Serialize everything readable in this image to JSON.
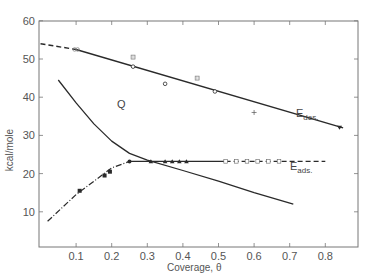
{
  "chart_data": {
    "type": "line",
    "title": "",
    "xlabel": "Coverage, θ",
    "ylabel": "kcal/mole",
    "xlim": [
      0.0,
      0.9
    ],
    "ylim": [
      0,
      60
    ],
    "x_ticks": [
      "0.1",
      "0.2",
      "0.3",
      "0.4",
      "0.5",
      "0.6",
      "0.7",
      "0.8"
    ],
    "y_ticks": [
      "10",
      "20",
      "30",
      "40",
      "50",
      "60"
    ],
    "grid": false,
    "legend": "none (curves labeled inline)",
    "annotations": [
      "Q",
      "E des.",
      "E ads."
    ],
    "series": [
      {
        "name": "E des.",
        "style": "solid line (dashed at low coverage)",
        "line": [
          [
            0.0,
            54.0
          ],
          [
            0.1,
            52.5
          ],
          [
            0.85,
            32.0
          ]
        ],
        "markers": [
          {
            "x": 0.1,
            "y": 52.5,
            "symbol": "double-circle"
          },
          {
            "x": 0.26,
            "y": 48.0,
            "symbol": "open-circle"
          },
          {
            "x": 0.26,
            "y": 50.5,
            "symbol": "hatched-square"
          },
          {
            "x": 0.35,
            "y": 43.5,
            "symbol": "open-circle"
          },
          {
            "x": 0.44,
            "y": 45.0,
            "symbol": "hatched-square"
          },
          {
            "x": 0.49,
            "y": 41.5,
            "symbol": "open-circle"
          },
          {
            "x": 0.6,
            "y": 36.0,
            "symbol": "plus"
          },
          {
            "x": 0.84,
            "y": 32.0,
            "symbol": "filled-triangle-down"
          }
        ]
      },
      {
        "name": "Q",
        "style": "solid curve",
        "line": [
          [
            0.05,
            44.5
          ],
          [
            0.1,
            38.5
          ],
          [
            0.15,
            33.0
          ],
          [
            0.2,
            28.5
          ],
          [
            0.25,
            25.3
          ],
          [
            0.3,
            23.5
          ],
          [
            0.4,
            20.8
          ],
          [
            0.5,
            18.0
          ],
          [
            0.6,
            15.0
          ],
          [
            0.71,
            12.0
          ]
        ]
      },
      {
        "name": "E ads.",
        "style": "dash-dot rising, solid plateau, dashed at high coverage",
        "line": [
          [
            0.02,
            7.5
          ],
          [
            0.1,
            14.5
          ],
          [
            0.2,
            21.5
          ],
          [
            0.25,
            23.2
          ],
          [
            0.52,
            23.2
          ],
          [
            0.8,
            23.2
          ]
        ],
        "markers": [
          {
            "x": 0.11,
            "y": 15.5,
            "symbol": "filled-square"
          },
          {
            "x": 0.18,
            "y": 19.5,
            "symbol": "filled-square"
          },
          {
            "x": 0.195,
            "y": 20.5,
            "symbol": "filled-square"
          },
          {
            "x": 0.25,
            "y": 23.2,
            "symbol": "filled-circle"
          },
          {
            "x": 0.31,
            "y": 23.2,
            "symbol": "filled-triangle"
          },
          {
            "x": 0.35,
            "y": 23.2,
            "symbol": "filled-triangle"
          },
          {
            "x": 0.37,
            "y": 23.2,
            "symbol": "filled-triangle"
          },
          {
            "x": 0.39,
            "y": 23.2,
            "symbol": "filled-triangle"
          },
          {
            "x": 0.41,
            "y": 23.2,
            "symbol": "filled-triangle"
          },
          {
            "x": 0.52,
            "y": 23.2,
            "symbol": "open-square"
          },
          {
            "x": 0.55,
            "y": 23.2,
            "symbol": "open-square"
          },
          {
            "x": 0.58,
            "y": 23.2,
            "symbol": "open-square"
          },
          {
            "x": 0.61,
            "y": 23.2,
            "symbol": "open-square"
          },
          {
            "x": 0.64,
            "y": 23.2,
            "symbol": "open-square"
          },
          {
            "x": 0.67,
            "y": 23.2,
            "symbol": "open-square"
          }
        ]
      }
    ]
  },
  "labels": {
    "q": "Q",
    "edes_main": "E",
    "edes_sub": "des.",
    "eads_main": "E",
    "eads_sub": "ads.",
    "xlabel": "Coverage, θ",
    "ylabel": "kcal/mole"
  },
  "colors": {
    "line": "#2a2a2a",
    "axis": "#777777",
    "text": "#555555"
  }
}
